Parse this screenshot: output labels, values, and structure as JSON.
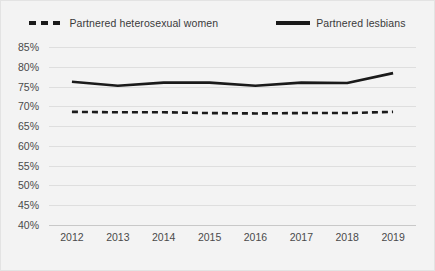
{
  "chart_data": {
    "type": "line",
    "title": "",
    "xlabel": "",
    "ylabel": "",
    "ylim": [
      40,
      85
    ],
    "ytick_step": 5,
    "grid": true,
    "legend_position": "top",
    "x": [
      "2012",
      "2013",
      "2014",
      "2015",
      "2016",
      "2017",
      "2018",
      "2019"
    ],
    "ytick_labels": [
      "85%",
      "80%",
      "75%",
      "70%",
      "65%",
      "60%",
      "55%",
      "50%",
      "45%",
      "40%"
    ],
    "ytick_values": [
      85,
      80,
      75,
      70,
      65,
      60,
      55,
      50,
      45,
      40
    ],
    "series": [
      {
        "name": "Partnered heterosexual women",
        "style": "dashed",
        "color": "#1a1a1a",
        "values": [
          68.6,
          68.5,
          68.5,
          68.3,
          68.2,
          68.3,
          68.3,
          68.6
        ]
      },
      {
        "name": "Partnered lesbians",
        "style": "solid",
        "color": "#1a1a1a",
        "values": [
          76.2,
          75.2,
          76.0,
          76.0,
          75.2,
          76.0,
          75.9,
          78.4
        ]
      }
    ]
  },
  "legend": {
    "items": [
      {
        "label": "Partnered heterosexual women",
        "style": "dashed"
      },
      {
        "label": "Partnered lesbians",
        "style": "solid"
      }
    ]
  }
}
